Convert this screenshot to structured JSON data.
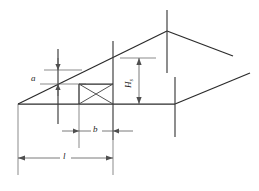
{
  "figure": {
    "kind": "engineering-dimension-diagram",
    "background_color": "#ffffff",
    "line_color": "#2b2b2b",
    "dimension_color": "#4f4f4f"
  },
  "labels": {
    "height_small": "a",
    "width_panel": "b",
    "span_length": "l",
    "height_main": "H",
    "height_main_subscript": "s"
  },
  "dimensions": [
    {
      "id": "a",
      "label": "a",
      "orientation": "vertical",
      "arrow_style": "outward-pair",
      "description": "small vertical offset at left post between eave line and sloped edge"
    },
    {
      "id": "b",
      "label": "b",
      "orientation": "horizontal",
      "arrow_style": "outward-pair",
      "description": "width of central braced panel at base"
    },
    {
      "id": "l",
      "label": "l",
      "orientation": "horizontal",
      "arrow_style": "double-headed-inward",
      "description": "overall span from left corner to central panel right edge"
    },
    {
      "id": "H",
      "label": "H",
      "subscript": "s",
      "orientation": "vertical",
      "arrow_style": "double-headed-inward",
      "description": "overall frame height at ridge-side column"
    }
  ],
  "geometry": {
    "base_line": {
      "x1": 18,
      "y1": 104,
      "x2": 175,
      "y2": 104
    },
    "base_line_right": {
      "x1": 175,
      "y1": 104,
      "x2": 250,
      "y2": 73
    },
    "left_ridge_line": {
      "x1": 18,
      "y1": 104,
      "x2": 167,
      "y2": 31
    },
    "ridge_right_line": {
      "x1": 167,
      "y1": 31,
      "x2": 233,
      "y2": 56
    },
    "mid_post": {
      "x": 113,
      "y1": 41,
      "y2": 140
    },
    "apex_post": {
      "x": 167,
      "y1": 10,
      "y2": 73
    },
    "right_post": {
      "x": 175,
      "y1": 77,
      "y2": 137
    },
    "left_post": {
      "x": 58,
      "y1": 49,
      "y2": 124
    },
    "corner_post": {
      "x": 18,
      "y1": 104,
      "y2": 175
    },
    "panel": {
      "x1": 79,
      "y1": 84,
      "x2": 113,
      "y2": 104
    }
  }
}
